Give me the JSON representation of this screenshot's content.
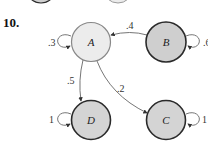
{
  "problem_number": "10.",
  "colors": {
    "node_light": "#ececec",
    "node_dark": "#cfcfcf",
    "stroke": "#2a2a2a",
    "edge": "#666666"
  },
  "nodes": [
    {
      "id": "A",
      "label": "A",
      "cx": 91,
      "cy": 42,
      "r": 19.5,
      "fill": "light"
    },
    {
      "id": "B",
      "label": "B",
      "cx": 166,
      "cy": 42,
      "r": 20,
      "fill": "dark"
    },
    {
      "id": "D",
      "label": "D",
      "cx": 91,
      "cy": 120,
      "r": 19.5,
      "fill": "dark"
    },
    {
      "id": "C",
      "label": "C",
      "cx": 166,
      "cy": 120,
      "r": 19.5,
      "fill": "dark"
    }
  ],
  "edges": [
    {
      "from": "B",
      "to": "A",
      "label": ".4"
    },
    {
      "from": "A",
      "to": "D",
      "label": ".5"
    },
    {
      "from": "A",
      "to": "C",
      "label": ".2"
    },
    {
      "from": "A",
      "to": "A",
      "label": ".3"
    },
    {
      "from": "B",
      "to": "B",
      "label": ".6"
    },
    {
      "from": "D",
      "to": "D",
      "label": "1"
    },
    {
      "from": "C",
      "to": "C",
      "label": "1"
    }
  ]
}
